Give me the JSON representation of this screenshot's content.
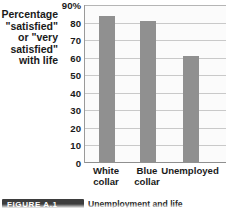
{
  "chart_data": {
    "type": "bar",
    "title": "",
    "xlabel": "",
    "ylabel": "Percentage \"satisfied\" or \"very satisfied\" with life",
    "ylabel_lines": [
      "Percentage",
      "\"satisfied\"",
      "or \"very",
      "satisfied\"",
      "with life"
    ],
    "categories": [
      "White collar",
      "Blue collar",
      "Unemployed"
    ],
    "category_lines": [
      [
        "White",
        "collar"
      ],
      [
        "Blue",
        "collar"
      ],
      [
        "Unemployed"
      ]
    ],
    "values": [
      84,
      81,
      61
    ],
    "ylim": [
      0,
      90
    ],
    "ytick_values": [
      0,
      10,
      20,
      30,
      40,
      50,
      60,
      70,
      80,
      90
    ],
    "ytick_labels": [
      "0",
      "10",
      "20",
      "30",
      "40",
      "50",
      "60",
      "70",
      "80",
      "90%"
    ],
    "grid": true,
    "legend": "none",
    "bar_color": "#909090",
    "grid_color": "#c9c9c9",
    "plot_background": "#fbfbfb"
  },
  "caption": {
    "badge": "FIGURE A.1",
    "text": "Unemployment and life"
  }
}
